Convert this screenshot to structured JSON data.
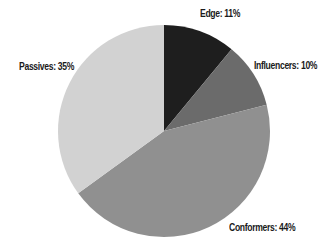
{
  "chart_data": {
    "type": "pie",
    "title": "",
    "start_angle": "12 o'clock, clockwise",
    "categories": [
      "Edge",
      "Influencers",
      "Conformers",
      "Passives"
    ],
    "values": [
      11,
      10,
      44,
      35
    ],
    "unit": "%",
    "colors": [
      "#1e1e1e",
      "#6b6b6b",
      "#909090",
      "#d2d2d2"
    ],
    "legend": "none (direct labels)"
  },
  "labels": {
    "edge": "Edge: 11%",
    "influencers": "Influencers: 10%",
    "conformers": "Conformers: 44%",
    "passives": "Passives: 35%"
  }
}
